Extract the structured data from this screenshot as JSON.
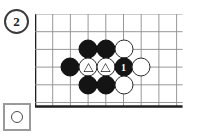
{
  "diagram": {
    "number_label": "2",
    "badge_name": "diagram-number-2"
  },
  "legend": {
    "stone_color": "white",
    "stone_icon": "white-stone-icon",
    "caption": ""
  },
  "board": {
    "type": "go-board-corner",
    "columns": 9,
    "rows": 6,
    "cell_size": 17.7,
    "edge_left_thick": true,
    "edge_bottom_thick": true,
    "grid_color": "#8c8c8c",
    "edge_color": "#1f1f1f",
    "line_width": 0.9,
    "edge_width": 2.6
  },
  "colors": {
    "black_stone": "#141414",
    "white_stone": "#ffffff",
    "stone_outline": "#2b2b2b",
    "grid": "#8c8c8c",
    "edge": "#1f1f1f",
    "badge_border": "#3b3b3b",
    "legend_border": "#9a9a9a"
  },
  "stones": [
    {
      "id": "s1",
      "color": "black",
      "col": 3,
      "row": 2,
      "label": "",
      "mark": ""
    },
    {
      "id": "s2",
      "color": "black",
      "col": 4,
      "row": 2,
      "label": "",
      "mark": ""
    },
    {
      "id": "s3",
      "color": "white",
      "col": 5,
      "row": 2,
      "label": "",
      "mark": ""
    },
    {
      "id": "s4",
      "color": "black",
      "col": 2,
      "row": 3,
      "label": "",
      "mark": ""
    },
    {
      "id": "s5",
      "color": "white",
      "col": 3,
      "row": 3,
      "label": "",
      "mark": "triangle"
    },
    {
      "id": "s6",
      "color": "white",
      "col": 4,
      "row": 3,
      "label": "",
      "mark": "triangle"
    },
    {
      "id": "s7",
      "color": "black",
      "col": 5,
      "row": 3,
      "label": "1",
      "mark": ""
    },
    {
      "id": "s8",
      "color": "white",
      "col": 6,
      "row": 3,
      "label": "",
      "mark": ""
    },
    {
      "id": "s9",
      "color": "black",
      "col": 3,
      "row": 4,
      "label": "",
      "mark": ""
    },
    {
      "id": "s10",
      "color": "black",
      "col": 4,
      "row": 4,
      "label": "",
      "mark": ""
    },
    {
      "id": "s11",
      "color": "white",
      "col": 5,
      "row": 4,
      "label": "",
      "mark": ""
    }
  ]
}
